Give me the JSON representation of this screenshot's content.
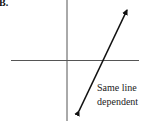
{
  "figure": {
    "label": "B.",
    "caption_line1": "Same line",
    "caption_line2": "dependent",
    "colors": {
      "axis": "#555555",
      "line": "#111111",
      "text": "#222222"
    },
    "axes": {
      "vertical_x": 67,
      "horizontal_y": 60
    },
    "line": {
      "x1": 78,
      "y1": 113,
      "x2": 128,
      "y2": 8,
      "intersection_x_axis": [
        104,
        60
      ],
      "arrows": "both"
    }
  }
}
